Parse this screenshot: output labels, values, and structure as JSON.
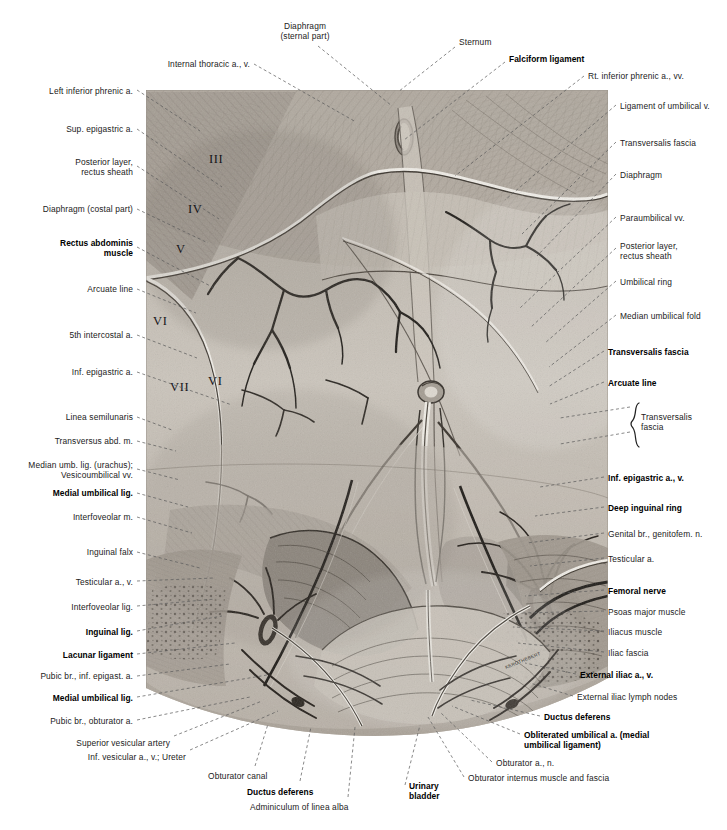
{
  "plate": {
    "title": "Anterior abdominal wall, posterior (internal) view",
    "figure_signature": "KEROTHEBERT"
  },
  "colors": {
    "ink": "#222222",
    "leader": "#5a5a5a",
    "paper": "#ffffff",
    "tissue_light": "#cfcac2",
    "tissue_mid": "#a49c92",
    "tissue_dark": "#6d665e"
  },
  "figure": {
    "roman_numerals": [
      {
        "text": "III",
        "x": 63,
        "y": 70
      },
      {
        "text": "IV",
        "x": 42,
        "y": 120
      },
      {
        "text": "V",
        "x": 32,
        "y": 160
      },
      {
        "text": "VI",
        "x": 9,
        "y": 232
      },
      {
        "text": "VII",
        "x": 26,
        "y": 298
      },
      {
        "text": "VI",
        "x": 63,
        "y": 291
      }
    ]
  },
  "labels_top": [
    {
      "name": "diaphragm-sternal-part",
      "text": "Diaphragm\n(sternal part)",
      "x": 305,
      "y": 22,
      "align": "c",
      "bold": false
    },
    {
      "name": "sternum",
      "text": "Sternum",
      "x": 459,
      "y": 38,
      "align": "l",
      "bold": false
    },
    {
      "name": "falciform-ligament",
      "text": "Falciform ligament",
      "x": 509,
      "y": 55,
      "align": "l",
      "bold": true
    },
    {
      "name": "internal-thoracic-a-v",
      "text": "Internal thoracic a., v.",
      "x": 250,
      "y": 60,
      "align": "r",
      "bold": false
    }
  ],
  "labels_left": [
    {
      "name": "left-inferior-phrenic-a",
      "text": "Left inferior phrenic a.",
      "x": 133,
      "y": 87,
      "bold": false
    },
    {
      "name": "sup-epigastric-a",
      "text": "Sup. epigastric a.",
      "x": 133,
      "y": 125,
      "bold": false
    },
    {
      "name": "posterior-layer-rectus-sheath-left",
      "text": "Posterior layer,\nrectus sheath",
      "x": 133,
      "y": 158,
      "bold": false
    },
    {
      "name": "diaphragm-costal-part",
      "text": "Diaphragm (costal part)",
      "x": 133,
      "y": 205,
      "bold": false
    },
    {
      "name": "rectus-abdominis-muscle",
      "text": "Rectus abdominis\nmuscle",
      "x": 133,
      "y": 239,
      "bold": true
    },
    {
      "name": "arcuate-line-left",
      "text": "Arcuate line",
      "x": 133,
      "y": 285,
      "bold": false
    },
    {
      "name": "fifth-intercostal-a",
      "text": "5th intercostal a.",
      "x": 133,
      "y": 331,
      "bold": false
    },
    {
      "name": "inf-epigastric-a",
      "text": "Inf. epigastric a.",
      "x": 133,
      "y": 368,
      "bold": false
    },
    {
      "name": "linea-semilunaris",
      "text": "Linea semilunaris",
      "x": 133,
      "y": 413,
      "bold": false
    },
    {
      "name": "transversus-abd-m",
      "text": "Transversus abd. m.",
      "x": 133,
      "y": 437,
      "bold": false
    },
    {
      "name": "median-umb-lig-urachus",
      "text": "Median umb. lig. (urachus);\nVesicoumbilical vv.",
      "x": 133,
      "y": 461,
      "bold": false
    },
    {
      "name": "medial-umbilical-lig-upper",
      "text": "Medial umbilical lig.",
      "x": 133,
      "y": 489,
      "bold": true
    },
    {
      "name": "interfoveolar-m",
      "text": "Interfoveolar m.",
      "x": 133,
      "y": 513,
      "bold": false
    },
    {
      "name": "inguinal-falx",
      "text": "Inguinal falx",
      "x": 133,
      "y": 548,
      "bold": false
    },
    {
      "name": "testicular-a-v-left",
      "text": "Testicular a., v.",
      "x": 133,
      "y": 578,
      "bold": false
    },
    {
      "name": "interfoveolar-lig",
      "text": "Interfoveolar lig.",
      "x": 133,
      "y": 603,
      "bold": false
    },
    {
      "name": "inguinal-lig",
      "text": "Inguinal lig.",
      "x": 133,
      "y": 628,
      "bold": true
    },
    {
      "name": "lacunar-ligament",
      "text": "Lacunar ligament",
      "x": 133,
      "y": 651,
      "bold": true
    },
    {
      "name": "pubic-br-inf-epigast-a",
      "text": "Pubic br., inf. epigast. a.",
      "x": 133,
      "y": 672,
      "bold": false
    },
    {
      "name": "medial-umbilical-lig-lower",
      "text": "Medial umbilical lig.",
      "x": 133,
      "y": 694,
      "bold": true
    },
    {
      "name": "pubic-br-obturator-a",
      "text": "Pubic br., obturator a.",
      "x": 133,
      "y": 717,
      "bold": false
    },
    {
      "name": "superior-vesicular-artery",
      "text": "Superior vesicular artery",
      "x": 170,
      "y": 739,
      "bold": false
    },
    {
      "name": "inf-vesicular-a-v-ureter",
      "text": "Inf. vesicular a., v.; Ureter",
      "x": 186,
      "y": 753,
      "bold": false
    }
  ],
  "labels_right": [
    {
      "name": "rt-inferior-phrenic-a-vv",
      "text": "Rt. inferior phrenic a., vv.",
      "x": 588,
      "y": 72,
      "bold": false
    },
    {
      "name": "ligament-of-umbilical-v",
      "text": "Ligament of umbilical v.",
      "x": 620,
      "y": 102,
      "bold": false
    },
    {
      "name": "transversalis-fascia-upper",
      "text": "Transversalis fascia",
      "x": 620,
      "y": 139,
      "bold": false
    },
    {
      "name": "diaphragm-right",
      "text": "Diaphragm",
      "x": 620,
      "y": 171,
      "bold": false
    },
    {
      "name": "paraumbilical-vv",
      "text": "Paraumbilical vv.",
      "x": 620,
      "y": 214,
      "bold": false
    },
    {
      "name": "posterior-layer-rectus-sheath-right",
      "text": "Posterior layer,\nrectus sheath",
      "x": 620,
      "y": 242,
      "bold": false
    },
    {
      "name": "umbilical-ring",
      "text": "Umbilical ring",
      "x": 620,
      "y": 278,
      "bold": false
    },
    {
      "name": "median-umbilical-fold",
      "text": "Median umbilical fold",
      "x": 620,
      "y": 312,
      "bold": false
    },
    {
      "name": "transversalis-fascia-bold",
      "text": "Transversalis fascia",
      "x": 608,
      "y": 348,
      "bold": true
    },
    {
      "name": "arcuate-line-right",
      "text": "Arcuate line",
      "x": 608,
      "y": 379,
      "bold": true
    },
    {
      "name": "transversalis-fascia-brace",
      "text": "Transversalis\nfascia",
      "x": 641,
      "y": 413,
      "bold": false
    },
    {
      "name": "inf-epigastric-a-v",
      "text": "Inf. epigastric a., v.",
      "x": 608,
      "y": 474,
      "bold": true
    },
    {
      "name": "deep-inguinal-ring",
      "text": "Deep inguinal ring",
      "x": 608,
      "y": 504,
      "bold": true
    },
    {
      "name": "genital-br-genitofem-n",
      "text": "Genital br., genitofem. n.",
      "x": 608,
      "y": 530,
      "bold": false
    },
    {
      "name": "testicular-a-right",
      "text": "Testicular a.",
      "x": 608,
      "y": 555,
      "bold": false
    },
    {
      "name": "femoral-nerve",
      "text": "Femoral nerve",
      "x": 608,
      "y": 587,
      "bold": true
    },
    {
      "name": "psoas-major-muscle",
      "text": "Psoas major muscle",
      "x": 608,
      "y": 608,
      "bold": false
    },
    {
      "name": "iliacus-muscle",
      "text": "Iliacus muscle",
      "x": 608,
      "y": 628,
      "bold": false
    },
    {
      "name": "iliac-fascia",
      "text": "Iliac fascia",
      "x": 608,
      "y": 649,
      "bold": false
    },
    {
      "name": "external-iliac-a-v",
      "text": "External iliac a., v.",
      "x": 580,
      "y": 671,
      "bold": true
    },
    {
      "name": "external-iliac-lymph-nodes",
      "text": "External iliac lymph nodes",
      "x": 577,
      "y": 693,
      "bold": false
    },
    {
      "name": "ductus-deferens-right",
      "text": "Ductus deferens",
      "x": 544,
      "y": 713,
      "bold": true
    },
    {
      "name": "obliterated-umbilical-a",
      "text": "Obliterated umbilical a. (medial\numbilical ligament)",
      "x": 524,
      "y": 731,
      "bold": true
    },
    {
      "name": "obturator-a-n",
      "text": "Obturator a., n.",
      "x": 496,
      "y": 759,
      "bold": false
    },
    {
      "name": "obturator-internus-muscle-fascia",
      "text": "Obturator internus muscle and fascia",
      "x": 468,
      "y": 774,
      "bold": false
    }
  ],
  "labels_bottom": [
    {
      "name": "obturator-canal",
      "text": "Obturator canal",
      "x": 208,
      "y": 772,
      "align": "l",
      "bold": false
    },
    {
      "name": "ductus-deferens-bottom",
      "text": "Ductus deferens",
      "x": 247,
      "y": 788,
      "align": "l",
      "bold": true
    },
    {
      "name": "adminiculum-of-linea-alba",
      "text": "Adminiculum of linea alba",
      "x": 250,
      "y": 803,
      "align": "l",
      "bold": false
    },
    {
      "name": "urinary-bladder",
      "text": "Urinary\nbladder",
      "x": 409,
      "y": 782,
      "align": "l",
      "bold": true
    }
  ],
  "leaders": [
    {
      "name": "leader-diaphragm-sternal",
      "d": "M 318,46 L 392,106",
      "style": "dash"
    },
    {
      "name": "leader-sternum",
      "d": "M 455,47 L 398,92",
      "style": "dash"
    },
    {
      "name": "leader-falciform",
      "d": "M 505,62 L 404,140",
      "style": "dash"
    },
    {
      "name": "leader-internal-thoracic",
      "d": "M 254,64 L 356,122",
      "style": "dash"
    },
    {
      "name": "leader-rt-inf-phrenic",
      "d": "M 584,76 L 455,176",
      "style": "dash"
    },
    {
      "name": "leader-lt-inf-phrenic",
      "d": "M 137,90 L 200,131",
      "style": "dash"
    },
    {
      "name": "leader-sup-epigastric",
      "d": "M 137,129 L 222,187",
      "style": "dash"
    },
    {
      "name": "leader-post-layer-left",
      "d": "M 137,166 L 219,219",
      "style": "dash"
    },
    {
      "name": "leader-diaphragm-costal",
      "d": "M 137,209 L 208,243",
      "style": "dash"
    },
    {
      "name": "leader-rectus-abdominis",
      "d": "M 137,247 L 214,288",
      "style": "dash"
    },
    {
      "name": "leader-arcuate-left",
      "d": "M 137,289 L 196,313",
      "style": "dash"
    },
    {
      "name": "leader-5th-intercostal",
      "d": "M 137,335 L 197,358",
      "style": "dash"
    },
    {
      "name": "leader-inf-epigastric-left",
      "d": "M 137,372 L 232,405",
      "style": "dash"
    },
    {
      "name": "leader-linea-semilunaris",
      "d": "M 137,417 L 172,430",
      "style": "dash"
    },
    {
      "name": "leader-transversus",
      "d": "M 137,441 L 176,451",
      "style": "dash"
    },
    {
      "name": "leader-median-umb-lig",
      "d": "M 137,469 L 180,480",
      "style": "dash"
    },
    {
      "name": "leader-medial-umb-upper",
      "d": "M 137,493 L 188,507",
      "style": "dash"
    },
    {
      "name": "leader-interfoveolar-m",
      "d": "M 137,517 L 192,533",
      "style": "dash"
    },
    {
      "name": "leader-inguinal-falx",
      "d": "M 137,552 L 200,568",
      "style": "dash"
    },
    {
      "name": "leader-testicular-left",
      "d": "M 137,581 L 214,578",
      "style": "dash"
    },
    {
      "name": "leader-interfoveolar-lig",
      "d": "M 137,606 L 215,599",
      "style": "dash"
    },
    {
      "name": "leader-inguinal-lig",
      "d": "M 137,631 L 222,616",
      "style": "dash"
    },
    {
      "name": "leader-lacunar",
      "d": "M 137,654 L 235,643",
      "style": "dash"
    },
    {
      "name": "leader-pubic-br-inf-epig",
      "d": "M 137,676 L 230,664",
      "style": "dash"
    },
    {
      "name": "leader-medial-umb-lower",
      "d": "M 137,697 L 267,675",
      "style": "dash"
    },
    {
      "name": "leader-pubic-br-obturator",
      "d": "M 137,720 L 250,697",
      "style": "dash"
    },
    {
      "name": "leader-sup-vesicular",
      "d": "M 174,736 L 262,701",
      "style": "dash"
    },
    {
      "name": "leader-inf-vesicular",
      "d": "M 190,750 L 278,711",
      "style": "dash"
    },
    {
      "name": "leader-obturator-canal",
      "d": "M 255,766 L 268,724",
      "style": "dash"
    },
    {
      "name": "leader-ductus-bottom",
      "d": "M 300,781 L 311,727",
      "style": "dash"
    },
    {
      "name": "leader-adminiculum",
      "d": "M 348,797 L 355,727",
      "style": "dash"
    },
    {
      "name": "leader-urinary-bladder",
      "d": "M 405,785 L 420,725",
      "style": "dash"
    },
    {
      "name": "leader-lig-umbilical-v",
      "d": "M 616,105 L 505,200",
      "style": "dash"
    },
    {
      "name": "leader-transversalis-upper",
      "d": "M 616,142 L 522,234",
      "style": "dash"
    },
    {
      "name": "leader-diaphragm-right",
      "d": "M 616,174 L 537,256",
      "style": "dash"
    },
    {
      "name": "leader-paraumbilical",
      "d": "M 616,217 L 520,308",
      "style": "dash"
    },
    {
      "name": "leader-post-layer-right",
      "d": "M 616,248 L 530,328",
      "style": "dash"
    },
    {
      "name": "leader-umbilical-ring",
      "d": "M 616,281 L 545,343",
      "style": "dash"
    },
    {
      "name": "leader-median-umb-fold",
      "d": "M 616,315 L 549,367",
      "style": "dash"
    },
    {
      "name": "leader-transversalis-bold",
      "d": "M 604,351 L 548,387",
      "style": "dash"
    },
    {
      "name": "leader-arcuate-right",
      "d": "M 604,382 L 550,404",
      "style": "dash"
    },
    {
      "name": "leader-brace-a",
      "d": "M 630,407 L 560,418",
      "style": "dash"
    },
    {
      "name": "leader-brace-b",
      "d": "M 630,432 L 560,444",
      "style": "dash"
    },
    {
      "name": "leader-inf-epig-right",
      "d": "M 604,477 L 540,487",
      "style": "dash"
    },
    {
      "name": "leader-deep-ing-ring",
      "d": "M 604,507 L 535,516",
      "style": "dash"
    },
    {
      "name": "leader-genital-br",
      "d": "M 604,533 L 527,543",
      "style": "dash"
    },
    {
      "name": "leader-testicular-right",
      "d": "M 604,558 L 530,566",
      "style": "dash"
    },
    {
      "name": "leader-femoral-nerve",
      "d": "M 604,590 L 525,596",
      "style": "dash"
    },
    {
      "name": "leader-psoas",
      "d": "M 604,611 L 520,613",
      "style": "dash"
    },
    {
      "name": "leader-iliacus",
      "d": "M 604,631 L 513,627",
      "style": "dash"
    },
    {
      "name": "leader-iliac-fascia",
      "d": "M 604,652 L 518,643",
      "style": "dash"
    },
    {
      "name": "leader-external-iliac",
      "d": "M 576,674 L 525,663",
      "style": "dash"
    },
    {
      "name": "leader-ext-iliac-nodes",
      "d": "M 573,696 L 530,683",
      "style": "dash"
    },
    {
      "name": "leader-ductus-right",
      "d": "M 540,716 L 470,700",
      "style": "dash"
    },
    {
      "name": "leader-obliterated-umb",
      "d": "M 520,734 L 452,706",
      "style": "dash"
    },
    {
      "name": "leader-obturator-a-n",
      "d": "M 492,762 L 440,712",
      "style": "dash"
    },
    {
      "name": "leader-obturator-internus",
      "d": "M 464,777 L 428,717",
      "style": "dash"
    }
  ]
}
